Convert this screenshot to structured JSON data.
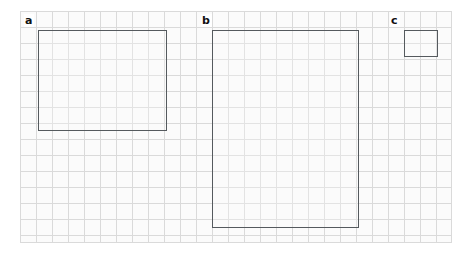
{
  "figure": {
    "width": 469,
    "height": 257,
    "background_color": "#ffffff"
  },
  "grid": {
    "name": "square-ruled-grid",
    "left": 20,
    "top": 11,
    "width": 432,
    "height": 232,
    "cell_size": 16,
    "columns": 27,
    "rows": 14.5,
    "line_color": "#c9c9c9",
    "fill_color": "#fcfcfc"
  },
  "panels": [
    {
      "id": "a",
      "label": "a",
      "label_x": 24,
      "label_y": 14,
      "rect": {
        "left": 38,
        "top": 30,
        "width": 129,
        "height": 101
      },
      "border_color": "#555a5e"
    },
    {
      "id": "b",
      "label": "b",
      "label_x": 201,
      "label_y": 14,
      "rect": {
        "left": 212,
        "top": 30,
        "width": 147,
        "height": 198
      },
      "border_color": "#555a5e"
    },
    {
      "id": "c",
      "label": "c",
      "label_x": 390,
      "label_y": 14,
      "rect": {
        "left": 404,
        "top": 30,
        "width": 34,
        "height": 27
      },
      "border_color": "#555a5e"
    }
  ]
}
